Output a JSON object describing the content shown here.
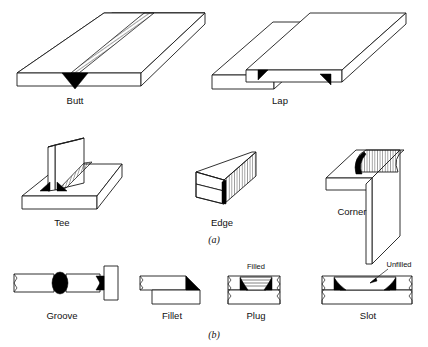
{
  "figure": {
    "background_color": "#ffffff",
    "line_color": "#1a1a1a",
    "weld_fill_color": "#000000",
    "sections": [
      {
        "id": "a",
        "label": "(a)",
        "caption": "Joint types"
      },
      {
        "id": "b",
        "label": "(b)",
        "caption": "Weld types"
      }
    ]
  },
  "joints": {
    "butt": {
      "label": "Butt",
      "weld_style": "bead-with-root",
      "row": 1
    },
    "lap": {
      "label": "Lap",
      "weld_style": "double-fillet",
      "row": 1
    },
    "tee": {
      "label": "Tee",
      "weld_style": "double-fillet-bead",
      "row": 2
    },
    "edge": {
      "label": "Edge",
      "weld_style": "edge-bead",
      "row": 2
    },
    "corner": {
      "label": "Corner",
      "weld_style": "rounded-bead",
      "row": 2
    }
  },
  "welds": {
    "groove": {
      "label": "Groove",
      "weld_style": "filled-groove",
      "row": 3
    },
    "fillet": {
      "label": "Fillet",
      "weld_style": "single-fillet",
      "row": 3
    },
    "plug": {
      "label": "Plug",
      "weld_style": "filled-cavity",
      "row": 3,
      "callout": "Filled"
    },
    "slot": {
      "label": "Slot",
      "weld_style": "unfilled-cavity",
      "row": 3,
      "callout": "Unfilled"
    }
  }
}
